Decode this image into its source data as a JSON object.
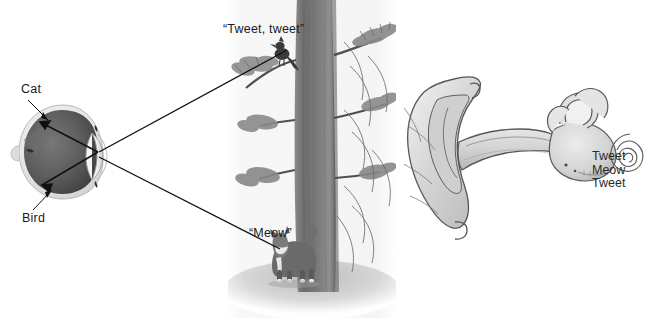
{
  "figure": {
    "width": 649,
    "height": 327,
    "background": "#ffffff"
  },
  "eye_diagram": {
    "name": "cross-section of human eye showing inverted retinal image",
    "labels": {
      "top": "Cat",
      "bottom": "Bird"
    },
    "colors": {
      "sclera": "#e9e9e9",
      "vitreous": "#5f5f5f",
      "retina_dark": "#4a4a4a",
      "lens": "#f2f2f2",
      "outline": "#2a2a2a"
    }
  },
  "scene_photo": {
    "name": "black and white photo of bird in tree and cat at base",
    "captions": {
      "bird_sound": "“Tweet, tweet”",
      "cat_sound": "“Meow”"
    },
    "colors": {
      "trunk": "#7e7e7e",
      "foliage": "#8d8d8d",
      "ground": "#cfcfcf",
      "panel": "#f6f6f6"
    }
  },
  "ear_diagram": {
    "name": "outer ear pinna, ear canal, and inner ear cochlea",
    "cochlea_output": [
      "Tweet",
      "Meow",
      "Tweet"
    ],
    "colors": {
      "fill": "#d8d8d8",
      "fill_light": "#ececec",
      "outline": "#555555",
      "shadow": "#b4b4b4"
    }
  },
  "sound_waves": {
    "name": "concentric arcs representing sound travelling to the ear",
    "stroke": "#6d6d6d",
    "count": 9
  },
  "light_rays": {
    "name": "straight lines showing light travelling from subjects to the eye",
    "stroke": "#111111",
    "count": 2
  }
}
